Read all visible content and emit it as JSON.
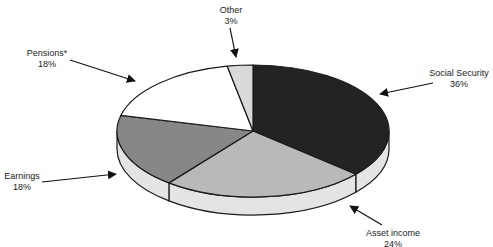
{
  "chart_data": {
    "type": "pie",
    "style": "3d-tilted",
    "title": "",
    "slices": [
      {
        "label": "Social Security",
        "value": 36,
        "display": "36%",
        "color": "#232323"
      },
      {
        "label": "Asset income",
        "value": 24,
        "display": "24%",
        "color": "#b9b9b9"
      },
      {
        "label": "Earnings",
        "value": 18,
        "display": "18%",
        "color": "#878787"
      },
      {
        "label": "Pensions*",
        "value": 18,
        "display": "18%",
        "color": "#ffffff"
      },
      {
        "label": "Other",
        "value": 3,
        "display": "3%",
        "color": "#d9d9d9"
      }
    ],
    "side_color": "#e4e4e4",
    "outline_color": "#1a1a1a"
  },
  "labels": {
    "social_security": {
      "name": "Social Security",
      "pct": "36%"
    },
    "asset_income": {
      "name": "Asset income",
      "pct": "24%"
    },
    "earnings": {
      "name": "Earnings",
      "pct": "18%"
    },
    "pensions": {
      "name": "Pensions*",
      "pct": "18%"
    },
    "other": {
      "name": "Other",
      "pct": "3%"
    }
  }
}
